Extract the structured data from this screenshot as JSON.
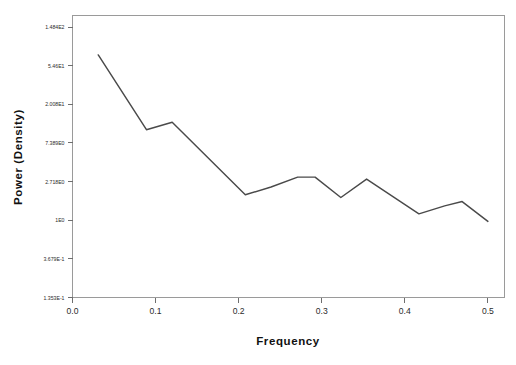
{
  "chart_data": {
    "type": "line",
    "title": "",
    "xlabel": "Frequency",
    "ylabel": "Power (Density)",
    "yscale": "log",
    "grid": false,
    "legend": null,
    "xlim": [
      0.0,
      0.52
    ],
    "ylim": [
      0.1353,
      200.0
    ],
    "xticks": [
      0.0,
      0.1,
      0.2,
      0.3,
      0.4,
      0.5
    ],
    "xtick_labels": [
      "0.0",
      "0.1",
      "0.2",
      "0.3",
      "0.4",
      "0.5"
    ],
    "yticks": [
      148.4,
      54.6,
      20.08,
      7.389,
      2.718,
      1.0,
      0.3679,
      0.1353
    ],
    "ytick_labels": [
      "1.484E2",
      "5.46E1",
      "2.008E1",
      "7.389E0",
      "2.718E0",
      "1E0",
      "3.679E-1",
      "1.353E-1"
    ],
    "series": [
      {
        "name": "Power (Density)",
        "x": [
          0.031,
          0.089,
          0.12,
          0.208,
          0.239,
          0.271,
          0.292,
          0.323,
          0.354,
          0.417,
          0.448,
          0.469,
          0.5
        ],
        "values": [
          72.0,
          10.4,
          12.6,
          1.93,
          2.36,
          3.05,
          3.05,
          1.8,
          2.9,
          1.18,
          1.45,
          1.62,
          0.97
        ]
      }
    ]
  },
  "axes": {
    "x_title": "Frequency",
    "y_title": "Power (Density)"
  }
}
